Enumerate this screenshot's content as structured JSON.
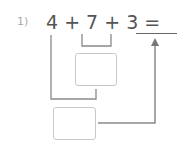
{
  "problem": {
    "number": "1)",
    "expression": "4 + 7 + 3 =",
    "answer_blank": ""
  },
  "boxes": [
    {
      "name": "partial-sum-box",
      "value": ""
    },
    {
      "name": "total-sum-box",
      "value": ""
    }
  ],
  "colors": {
    "text": "#555555",
    "lines": "#8a8a8a",
    "box_border": "#c8c8c8"
  }
}
